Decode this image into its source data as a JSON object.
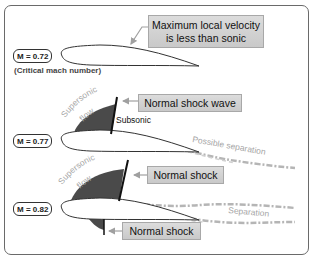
{
  "colors": {
    "frame": "#6a6a6a",
    "callout_fill": "#d3d3d3",
    "callout_border": "#a8a8a8",
    "supersonic_region": "#4a4a4a",
    "shock_line": "#111111",
    "airfoil_fill": "#ffffff",
    "airfoil_stroke": "#333333",
    "wake": "#b5b5b5",
    "grey_text": "#a6a6a6",
    "arrow": "#a0a0a0"
  },
  "panels": [
    {
      "mach_label": "M = 0.72",
      "note": "(Critical mach number)",
      "callout": "Maximum local velocity is less than sonic",
      "callout_line1": "Maximum local velocity",
      "callout_line2": "is less than sonic"
    },
    {
      "mach_label": "M = 0.77",
      "supersonic_label_1": "Supersonic",
      "supersonic_label_2": "flow",
      "subsonic_label": "Subsonic",
      "separation_label": "Possible separation",
      "callout": "Normal shock wave"
    },
    {
      "mach_label": "M = 0.82",
      "supersonic_label_1": "Supersonic",
      "supersonic_label_2": "flow",
      "separation_label": "Separation",
      "callout_upper": "Normal shock",
      "callout_lower": "Normal shock"
    }
  ]
}
